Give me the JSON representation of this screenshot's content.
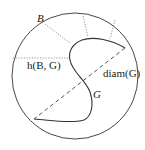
{
  "diagram": {
    "labels": {
      "ball": "B",
      "distance": "h(B, G)",
      "diameter": "diam(G)",
      "set": "G"
    },
    "colors": {
      "stroke": "#333333",
      "dotted": "#777777",
      "dashed": "#555555",
      "background": "#ffffff"
    },
    "elements": [
      "circle B (boundary)",
      "closed curve G (boundary of set)",
      "dashed diameter segment",
      "dotted Hausdorff distance segments"
    ]
  }
}
